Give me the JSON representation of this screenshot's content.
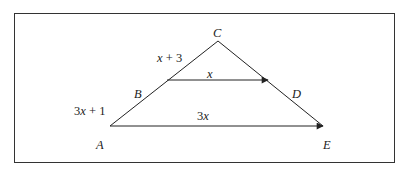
{
  "diagram": {
    "type": "triangle-parallel-lines",
    "points": {
      "A": {
        "label": "A",
        "x": 110,
        "y": 126
      },
      "B": {
        "label": "B",
        "x": 167,
        "y": 80
      },
      "C": {
        "label": "C",
        "x": 218,
        "y": 41
      },
      "D": {
        "label": "D",
        "x": 268,
        "y": 80
      },
      "E": {
        "label": "E",
        "x": 323,
        "y": 126
      }
    },
    "segment_labels": {
      "BC": "x + 3",
      "AB": "3x + 1",
      "BD": "x",
      "AE": "3x"
    },
    "relations": [
      "BD ∥ AE"
    ],
    "stroke_color": "#222222"
  }
}
